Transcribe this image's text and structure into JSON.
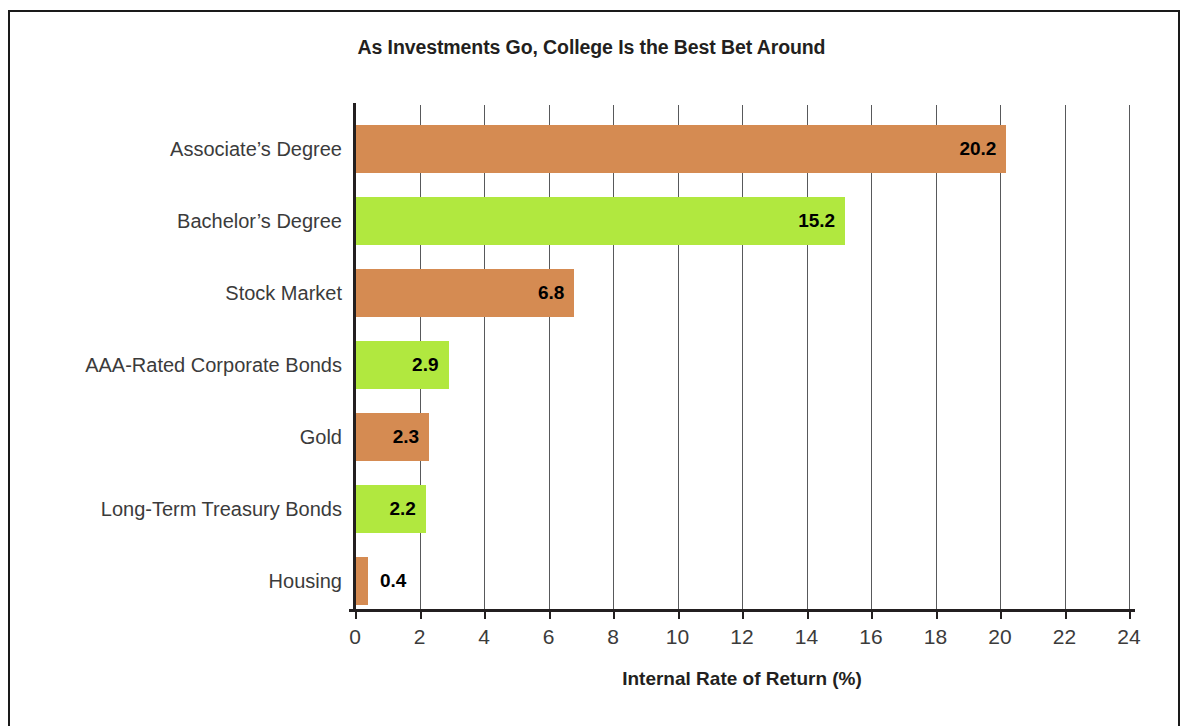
{
  "chart_data": {
    "type": "bar",
    "orientation": "horizontal",
    "title": "As Investments Go, College Is the Best Bet Around",
    "xlabel": "Internal Rate of Return (%)",
    "ylabel": "",
    "xlim": [
      0,
      24
    ],
    "xticks": [
      0,
      2,
      4,
      6,
      8,
      10,
      12,
      14,
      16,
      18,
      20,
      22,
      24
    ],
    "xtick_labels": [
      "0",
      "2",
      "4",
      "6",
      "8",
      "10",
      "12",
      "14",
      "16",
      "18",
      "20",
      "22",
      "24"
    ],
    "grid": "vertical",
    "legend": "none",
    "categories": [
      "Associate’s Degree",
      "Bachelor’s Degree",
      "Stock Market",
      "AAA-Rated Corporate Bonds",
      "Gold",
      "Long-Term Treasury Bonds",
      "Housing"
    ],
    "values": [
      20.2,
      15.2,
      6.8,
      2.9,
      2.3,
      2.2,
      0.4
    ],
    "value_labels": [
      "20.2",
      "15.2",
      "6.8",
      "2.9",
      "2.3",
      "2.2",
      "0.4"
    ],
    "bar_colors": [
      "#d58b52",
      "#b1e83f",
      "#d58b52",
      "#b1e83f",
      "#d58b52",
      "#b1e83f",
      "#d58b52"
    ],
    "label_placement": [
      "inside",
      "inside",
      "inside",
      "inside",
      "inside",
      "inside",
      "outside"
    ],
    "bars": [
      {
        "category": "Associate’s Degree",
        "value": 20.2,
        "label": "20.2",
        "color": "#d58b52",
        "label_placement": "inside"
      },
      {
        "category": "Bachelor’s Degree",
        "value": 15.2,
        "label": "15.2",
        "color": "#b1e83f",
        "label_placement": "inside"
      },
      {
        "category": "Stock Market",
        "value": 6.8,
        "label": "6.8",
        "color": "#d58b52",
        "label_placement": "inside"
      },
      {
        "category": "AAA-Rated Corporate Bonds",
        "value": 2.9,
        "label": "2.9",
        "color": "#b1e83f",
        "label_placement": "inside"
      },
      {
        "category": "Gold",
        "value": 2.3,
        "label": "2.3",
        "color": "#d58b52",
        "label_placement": "inside"
      },
      {
        "category": "Long-Term Treasury Bonds",
        "value": 2.2,
        "label": "2.2",
        "color": "#b1e83f",
        "label_placement": "inside"
      },
      {
        "category": "Housing",
        "value": 0.4,
        "label": "0.4",
        "color": "#d58b52",
        "label_placement": "outside"
      }
    ]
  },
  "colors": {
    "orange": "#d58b52",
    "green": "#b1e83f",
    "axis": "#231f20",
    "grid": "#58595b",
    "text": "#3b3b3b",
    "frame": "#1a1a1a",
    "background": "#ffffff"
  }
}
